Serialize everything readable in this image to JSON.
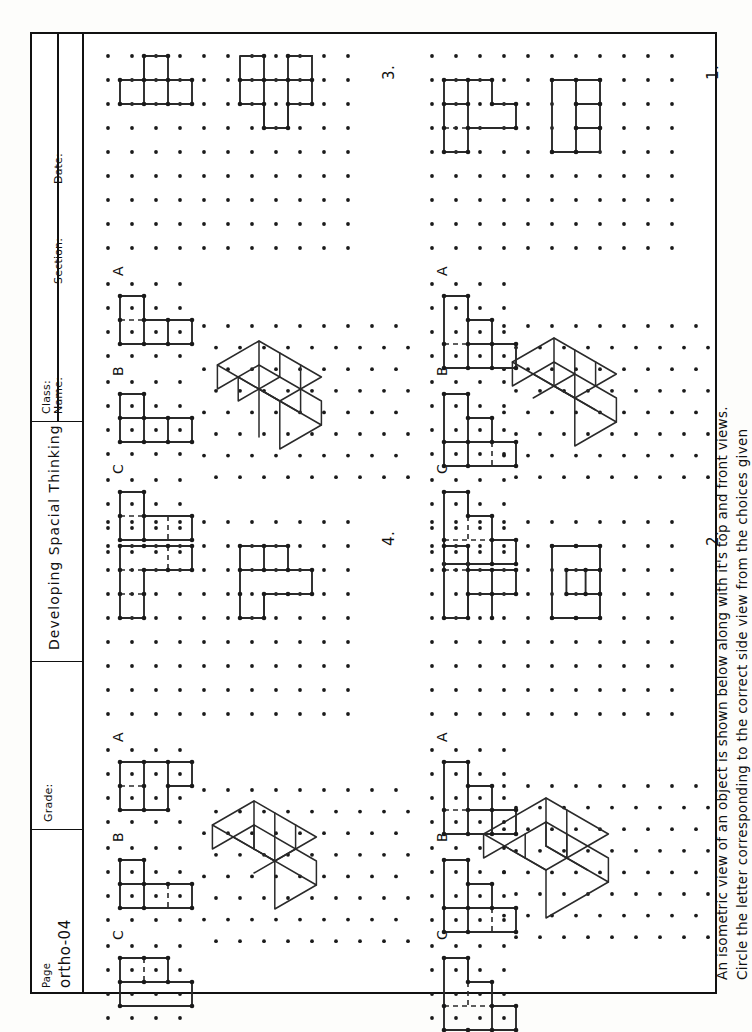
{
  "worksheet": {
    "instruction_line1": "An isometric view of an object is shown below along with it's top and front views.",
    "instruction_line2": "Circle the letter corresponding to the correct side view from the choices given"
  },
  "title_block": {
    "name_label": "Name:",
    "class_label": "Class:",
    "section_label": "Section:",
    "date_label": "Date:",
    "series_title": "Developing Spacial Thinking",
    "grade_label": "Grade:",
    "page_label": "Page",
    "page_value": "ortho-04"
  },
  "problems": [
    {
      "number": "1.",
      "choices": [
        "A",
        "B",
        "C"
      ]
    },
    {
      "number": "2.",
      "choices": [
        "A",
        "B",
        "C"
      ]
    },
    {
      "number": "3.",
      "choices": [
        "A",
        "B",
        "C"
      ]
    },
    {
      "number": "4.",
      "choices": [
        "A",
        "B",
        "C"
      ]
    }
  ],
  "colors": {
    "ink": "#1a1a1a",
    "line": "#2a2a2a",
    "border": "#111111",
    "paper": "#ffffff",
    "background": "#fdfdfb"
  },
  "grid": {
    "square_pitch_px": 24,
    "iso_pitch_px": 24,
    "dot_radius_px": 1.9
  }
}
